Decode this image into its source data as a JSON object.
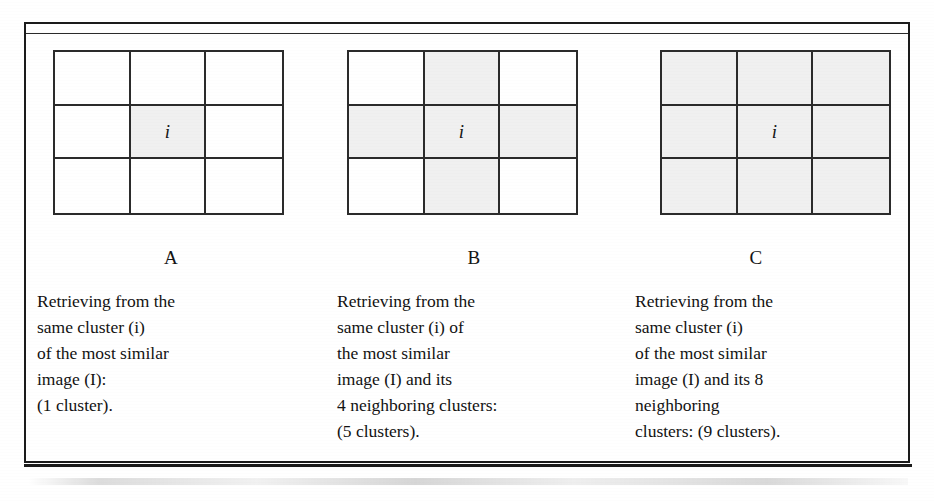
{
  "figure": {
    "shade_color": "#f0f0f0",
    "line_color": "#2b2b2b",
    "center_label": "i",
    "panels": [
      {
        "id": "A",
        "letter": "A",
        "grid": {
          "rows": 3,
          "cols": 3,
          "shaded_cells": [
            4
          ],
          "center_label": "i"
        },
        "caption_lines": [
          "Retrieving from the",
          "same cluster (i)",
          "of the most similar",
          "image (I):",
          "(1 cluster)."
        ],
        "cluster_count": "1 cluster"
      },
      {
        "id": "B",
        "letter": "B",
        "grid": {
          "rows": 3,
          "cols": 3,
          "shaded_cells": [
            1,
            3,
            4,
            5,
            7
          ],
          "center_label": "i"
        },
        "caption_lines": [
          "Retrieving from the",
          "same cluster (i) of",
          "the most similar",
          "image (I) and its",
          "4 neighboring clusters:",
          "(5 clusters)."
        ],
        "cluster_count": "5 clusters"
      },
      {
        "id": "C",
        "letter": "C",
        "grid": {
          "rows": 3,
          "cols": 3,
          "shaded_cells": [
            0,
            1,
            2,
            3,
            4,
            5,
            6,
            7,
            8
          ],
          "center_label": "i"
        },
        "caption_lines": [
          "Retrieving from the",
          "same cluster (i)",
          "of the most similar",
          "image (I) and its 8",
          "neighboring",
          "clusters: (9 clusters)."
        ],
        "cluster_count": "9 clusters"
      }
    ]
  }
}
